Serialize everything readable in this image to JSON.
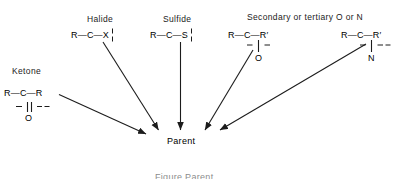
{
  "diagram": {
    "title_caption": "Figure  Parent",
    "parent_node": "Parent",
    "groups": [
      {
        "id": "ketone",
        "label": "Ketone",
        "formula_left": "R",
        "bond_left": "—",
        "center_atom": "C",
        "bond_right": "—",
        "formula_right": "R",
        "below_atom": "O",
        "bond_type": "double",
        "cut_marks": "dashed-horizontal-both-sides"
      },
      {
        "id": "halide",
        "label": "Halide",
        "formula_left": "R",
        "bond_left": "—",
        "center_atom": "C",
        "bond_right": "—",
        "formula_right": "X",
        "below_atom": "",
        "bond_type": "single",
        "cut_marks": "dashed-vertical-on-bond"
      },
      {
        "id": "sulfide",
        "label": "Sulfide",
        "formula_left": "R",
        "bond_left": "—",
        "center_atom": "C",
        "bond_right": "—",
        "formula_right": "S",
        "below_atom": "",
        "bond_type": "single",
        "cut_marks": "dashed-vertical-on-bond"
      },
      {
        "id": "secondary-o",
        "label": "Secondary or tertiary O or N",
        "formula_left": "R",
        "bond_left": "—",
        "center_atom": "C",
        "bond_right": "—",
        "formula_right": "R′",
        "below_atom": "O",
        "bond_type": "single",
        "cut_marks": "dashed-horizontal-both-sides"
      },
      {
        "id": "tertiary-n",
        "label": "",
        "formula_left": "R",
        "bond_left": "—",
        "center_atom": "C",
        "bond_right": "—",
        "formula_right": "R′",
        "below_atom": "N",
        "bond_type": "single",
        "cut_marks": "dashed-horizontal-both-sides"
      }
    ],
    "arrows": [
      {
        "from": "ketone",
        "to": "parent"
      },
      {
        "from": "halide",
        "to": "parent"
      },
      {
        "from": "sulfide",
        "to": "parent"
      },
      {
        "from": "secondary-o",
        "to": "parent"
      },
      {
        "from": "tertiary-n",
        "to": "parent"
      }
    ],
    "colors": {
      "background": "#ffffff",
      "ink": "#000000",
      "label_ink": "#1a1a1a"
    }
  }
}
